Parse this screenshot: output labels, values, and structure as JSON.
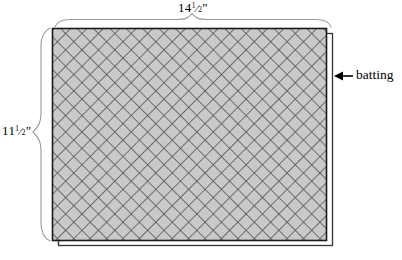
{
  "diagram": {
    "fill_color": "#c9c9c9",
    "hatch_color": "#4f4f4f",
    "outline_color": "#1a1a1a",
    "brace_color": "#8c8c8c",
    "background_color": "#ffffff",
    "width_label": {
      "whole": "14",
      "numerator": "1",
      "denominator": "2",
      "unit": "\"",
      "text": "14½\""
    },
    "height_label": {
      "whole": "11",
      "numerator": "1",
      "denominator": "2",
      "unit": "\"",
      "text": "11½\""
    },
    "callout": {
      "label": "batting",
      "arrow": "left-arrow-icon"
    },
    "shapes": {
      "hatched_rect": {
        "x": 52,
        "y": 28,
        "width": 275,
        "height": 213
      },
      "batting_rect": {
        "x": 58,
        "y": 33,
        "width": 275,
        "height": 213
      },
      "top_brace": {
        "x1": 55,
        "x2": 331,
        "y": 24,
        "tip_x": 192
      },
      "left_brace": {
        "y1": 28,
        "y2": 241,
        "x": 48,
        "tip_y": 132
      },
      "arrow": {
        "from_x": 352,
        "to_x": 334,
        "y": 76
      }
    }
  }
}
